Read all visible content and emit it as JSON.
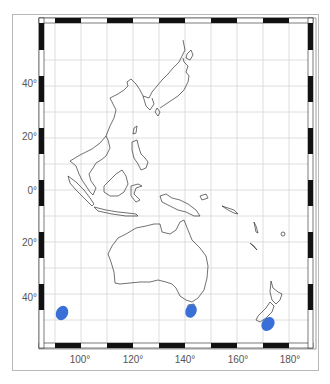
{
  "map": {
    "region": "Western Pacific / Australasia",
    "graticule_step_deg": 10,
    "lat_labels": [
      {
        "text": "40°",
        "y": 83
      },
      {
        "text": "20°",
        "y": 136
      },
      {
        "text": "0°",
        "y": 190
      },
      {
        "text": "20°",
        "y": 242
      },
      {
        "text": "40°",
        "y": 297
      }
    ],
    "lon_labels": [
      {
        "text": "100°",
        "x": 80
      },
      {
        "text": "120°",
        "x": 133
      },
      {
        "text": "140°",
        "x": 185
      },
      {
        "text": "160°",
        "x": 238
      },
      {
        "text": "180°",
        "x": 290
      }
    ],
    "markers": [
      {
        "name": "marker-indian-ocean",
        "cx": 62,
        "cy": 313,
        "color": "#3a6fd8"
      },
      {
        "name": "marker-tasmania",
        "cx": 191,
        "cy": 311,
        "color": "#3a6fd8"
      },
      {
        "name": "marker-new-zealand-south",
        "cx": 268,
        "cy": 324,
        "color": "#3a6fd8"
      }
    ],
    "colors": {
      "coastline": "#333333",
      "grid": "#d6d6d6",
      "frame_dark": "#111111",
      "marker": "#3a6fd8"
    }
  }
}
